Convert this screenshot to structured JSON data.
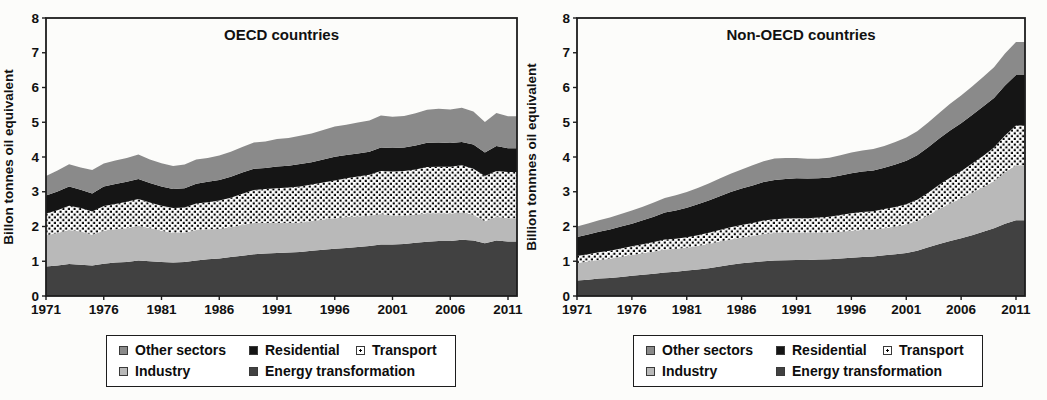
{
  "page": {
    "background": "#fcfcfa"
  },
  "colors": {
    "axis": "#1d1d1d",
    "text": "#111111",
    "other_sectors": "#8a8a8a",
    "residential": "#151515",
    "transport_bg": "#ffffff",
    "transport_dot": "#000000",
    "industry": "#b9b9b9",
    "energy_transformation": "#414141"
  },
  "legend": {
    "items": [
      {
        "key": "other_sectors",
        "label": "Other sectors"
      },
      {
        "key": "residential",
        "label": "Residential"
      },
      {
        "key": "transport",
        "label": "Transport"
      },
      {
        "key": "industry",
        "label": "Industry"
      },
      {
        "key": "energy_transformation",
        "label": "Energy transformation"
      }
    ]
  },
  "chart_data": [
    {
      "type": "area",
      "stacked": true,
      "title": "OECD countries",
      "ylabel": "Billon tonnes oil equivalent",
      "x_start": 1971,
      "x_end": 2011,
      "xticks": [
        1971,
        1976,
        1981,
        1986,
        1991,
        1996,
        2001,
        2006,
        2011
      ],
      "ylim": [
        0,
        8
      ],
      "yticks": [
        0,
        1,
        2,
        3,
        4,
        5,
        6,
        7,
        8
      ],
      "series": [
        {
          "key": "energy_transformation",
          "name": "Energy transformation",
          "values": [
            0.85,
            0.88,
            0.92,
            0.9,
            0.88,
            0.93,
            0.96,
            0.98,
            1.02,
            1.0,
            0.98,
            0.96,
            0.98,
            1.02,
            1.06,
            1.08,
            1.12,
            1.16,
            1.2,
            1.22,
            1.24,
            1.25,
            1.27,
            1.3,
            1.33,
            1.36,
            1.38,
            1.41,
            1.44,
            1.48,
            1.48,
            1.5,
            1.53,
            1.56,
            1.58,
            1.58,
            1.62,
            1.6,
            1.52,
            1.6,
            1.57
          ]
        },
        {
          "key": "industry",
          "name": "Industry",
          "values": [
            0.9,
            0.93,
            0.98,
            0.96,
            0.88,
            0.95,
            0.96,
            0.97,
            1.0,
            0.95,
            0.9,
            0.85,
            0.84,
            0.88,
            0.86,
            0.85,
            0.86,
            0.89,
            0.9,
            0.88,
            0.86,
            0.85,
            0.84,
            0.86,
            0.87,
            0.87,
            0.89,
            0.88,
            0.87,
            0.88,
            0.84,
            0.82,
            0.81,
            0.82,
            0.8,
            0.79,
            0.78,
            0.74,
            0.63,
            0.68,
            0.67
          ]
        },
        {
          "key": "transport",
          "name": "Transport",
          "values": [
            0.62,
            0.66,
            0.7,
            0.67,
            0.67,
            0.71,
            0.73,
            0.76,
            0.77,
            0.74,
            0.72,
            0.72,
            0.73,
            0.76,
            0.78,
            0.82,
            0.85,
            0.89,
            0.95,
            0.98,
            1.0,
            1.02,
            1.04,
            1.05,
            1.07,
            1.09,
            1.12,
            1.15,
            1.18,
            1.24,
            1.26,
            1.28,
            1.3,
            1.33,
            1.34,
            1.35,
            1.36,
            1.32,
            1.3,
            1.32,
            1.33
          ]
        },
        {
          "key": "residential",
          "name": "Residential",
          "values": [
            0.52,
            0.54,
            0.55,
            0.53,
            0.52,
            0.56,
            0.57,
            0.58,
            0.58,
            0.56,
            0.55,
            0.55,
            0.55,
            0.57,
            0.59,
            0.59,
            0.6,
            0.61,
            0.61,
            0.6,
            0.63,
            0.63,
            0.65,
            0.64,
            0.66,
            0.69,
            0.67,
            0.66,
            0.66,
            0.67,
            0.68,
            0.67,
            0.69,
            0.7,
            0.7,
            0.68,
            0.67,
            0.7,
            0.68,
            0.72,
            0.68
          ]
        },
        {
          "key": "other_sectors",
          "name": "Other sectors",
          "values": [
            0.56,
            0.6,
            0.64,
            0.64,
            0.68,
            0.66,
            0.68,
            0.68,
            0.7,
            0.68,
            0.67,
            0.66,
            0.68,
            0.7,
            0.68,
            0.7,
            0.72,
            0.74,
            0.76,
            0.77,
            0.79,
            0.8,
            0.81,
            0.83,
            0.85,
            0.87,
            0.87,
            0.89,
            0.9,
            0.92,
            0.9,
            0.91,
            0.93,
            0.95,
            0.97,
            0.97,
            0.99,
            0.95,
            0.88,
            0.95,
            0.92
          ]
        }
      ]
    },
    {
      "type": "area",
      "stacked": true,
      "title": "Non-OECD countries",
      "ylabel": "Billion tonnnes oil equivalent",
      "x_start": 1971,
      "x_end": 2011,
      "xticks": [
        1971,
        1976,
        1981,
        1986,
        1991,
        1996,
        2001,
        2006,
        2011
      ],
      "ylim": [
        0,
        8
      ],
      "yticks": [
        0,
        1,
        2,
        3,
        4,
        5,
        6,
        7,
        8
      ],
      "series": [
        {
          "key": "energy_transformation",
          "name": "Energy transformation",
          "values": [
            0.45,
            0.47,
            0.5,
            0.52,
            0.55,
            0.58,
            0.61,
            0.64,
            0.68,
            0.7,
            0.73,
            0.76,
            0.8,
            0.85,
            0.9,
            0.94,
            0.97,
            1.0,
            1.02,
            1.03,
            1.04,
            1.04,
            1.05,
            1.06,
            1.08,
            1.1,
            1.12,
            1.14,
            1.17,
            1.2,
            1.24,
            1.3,
            1.4,
            1.5,
            1.58,
            1.66,
            1.75,
            1.85,
            1.95,
            2.08,
            2.18
          ]
        },
        {
          "key": "industry",
          "name": "Industry",
          "values": [
            0.5,
            0.52,
            0.54,
            0.55,
            0.58,
            0.6,
            0.62,
            0.64,
            0.66,
            0.66,
            0.66,
            0.68,
            0.7,
            0.72,
            0.73,
            0.74,
            0.76,
            0.78,
            0.79,
            0.79,
            0.78,
            0.77,
            0.76,
            0.76,
            0.77,
            0.78,
            0.78,
            0.77,
            0.78,
            0.8,
            0.82,
            0.86,
            0.92,
            1.0,
            1.08,
            1.15,
            1.22,
            1.28,
            1.35,
            1.48,
            1.58
          ]
        },
        {
          "key": "transport",
          "name": "Transport",
          "values": [
            0.2,
            0.21,
            0.22,
            0.23,
            0.24,
            0.25,
            0.26,
            0.27,
            0.29,
            0.29,
            0.3,
            0.31,
            0.32,
            0.33,
            0.35,
            0.36,
            0.37,
            0.39,
            0.4,
            0.41,
            0.42,
            0.43,
            0.45,
            0.46,
            0.48,
            0.5,
            0.52,
            0.53,
            0.55,
            0.56,
            0.58,
            0.61,
            0.65,
            0.7,
            0.74,
            0.78,
            0.84,
            0.9,
            0.97,
            1.06,
            1.15
          ]
        },
        {
          "key": "residential",
          "name": "Residential",
          "values": [
            0.55,
            0.57,
            0.59,
            0.61,
            0.63,
            0.65,
            0.69,
            0.73,
            0.77,
            0.81,
            0.85,
            0.89,
            0.93,
            0.97,
            1.01,
            1.05,
            1.08,
            1.11,
            1.13,
            1.14,
            1.15,
            1.14,
            1.13,
            1.13,
            1.14,
            1.15,
            1.16,
            1.17,
            1.19,
            1.22,
            1.25,
            1.28,
            1.31,
            1.33,
            1.36,
            1.38,
            1.4,
            1.42,
            1.43,
            1.44,
            1.45
          ]
        },
        {
          "key": "other_sectors",
          "name": "Other sectors",
          "values": [
            0.3,
            0.32,
            0.33,
            0.35,
            0.36,
            0.38,
            0.39,
            0.41,
            0.42,
            0.44,
            0.45,
            0.47,
            0.49,
            0.51,
            0.53,
            0.55,
            0.58,
            0.6,
            0.62,
            0.6,
            0.58,
            0.57,
            0.56,
            0.57,
            0.58,
            0.6,
            0.61,
            0.62,
            0.63,
            0.65,
            0.67,
            0.69,
            0.71,
            0.74,
            0.77,
            0.8,
            0.82,
            0.85,
            0.88,
            0.92,
            0.95
          ]
        }
      ]
    }
  ]
}
